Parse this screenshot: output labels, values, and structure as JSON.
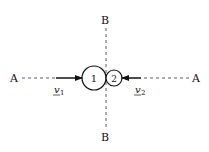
{
  "diagram": {
    "axis_a": {
      "left_label": "A",
      "right_label": "A"
    },
    "axis_b": {
      "top_label": "B",
      "bottom_label": "B"
    },
    "body1": {
      "label": "1"
    },
    "body2": {
      "label": "2"
    },
    "velocity1": {
      "symbol": "v",
      "subscript": "1"
    },
    "velocity2": {
      "symbol": "v",
      "subscript": "2"
    },
    "colors": {
      "ink": "#111111",
      "background": "#ffffff"
    }
  }
}
